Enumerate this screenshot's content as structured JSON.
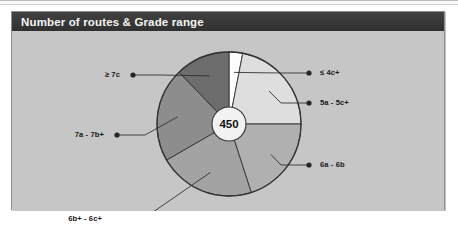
{
  "panel": {
    "title": "Number of routes & Grade range"
  },
  "center": {
    "value": "450",
    "label": "total-routes"
  },
  "chart_data": {
    "type": "pie",
    "title": "Number of routes & Grade range",
    "center_label": "450",
    "total": 450,
    "legend_position": "callout-labels",
    "categories": [
      "≤ 4c+",
      "5a - 5c+",
      "6a - 6b",
      "6b+ - 6c+",
      "7a - 7b+",
      "≥ 7c"
    ],
    "values": [
      3,
      22,
      20,
      22,
      21,
      12
    ],
    "unit": "percent",
    "slices": [
      {
        "label": "≤ 4c+",
        "percent": 3,
        "start_deg": 0,
        "end_deg": 11,
        "color": "#fdfdfd",
        "label_side": "right",
        "label_x": 305,
        "label_y": 38
      },
      {
        "label": "5a - 5c+",
        "percent": 22,
        "start_deg": 11,
        "end_deg": 90,
        "color": "#dedede",
        "label_side": "right",
        "label_x": 305,
        "label_y": 68
      },
      {
        "label": "6a - 6b",
        "percent": 20,
        "start_deg": 90,
        "end_deg": 162,
        "color": "#b0b0b0",
        "label_side": "right",
        "label_x": 305,
        "label_y": 130
      },
      {
        "label": "6b+ - 6c+",
        "percent": 22,
        "start_deg": 162,
        "end_deg": 240,
        "color": "#a3a3a3",
        "label_side": "left",
        "label_x": 95,
        "label_y": 184
      },
      {
        "label": "7a - 7b+",
        "percent": 21,
        "start_deg": 240,
        "end_deg": 316,
        "color": "#8d8d8d",
        "label_side": "left",
        "label_x": 97,
        "label_y": 100
      },
      {
        "label": "≥ 7c",
        "percent": 12,
        "start_deg": 316,
        "end_deg": 360,
        "color": "#6d6d6d",
        "label_side": "left",
        "label_x": 113,
        "label_y": 40
      }
    ],
    "colors": {
      "panel_background": "#c6c6c6",
      "title_bar": "#3a3a3a",
      "title_text": "#f4f4f4",
      "pie_outline": "#333333",
      "leader_line": "#2b2b2b",
      "center_circle": "#f2f2f2"
    }
  }
}
